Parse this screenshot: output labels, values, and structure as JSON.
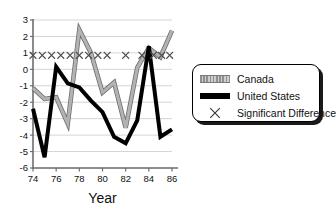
{
  "chart_data": {
    "type": "line",
    "title": "",
    "xlabel": "Year",
    "ylabel": "",
    "xlim": [
      74,
      86
    ],
    "ylim": [
      -6,
      3
    ],
    "grid": true,
    "grid_axis": "y",
    "legend_position": "right-outside",
    "x": [
      74,
      75,
      76,
      77,
      78,
      79,
      80,
      81,
      82,
      83,
      84,
      85,
      86
    ],
    "xtick_labels": [
      "74",
      "76",
      "78",
      "80",
      "82",
      "84",
      "86"
    ],
    "xtick_values": [
      74,
      76,
      78,
      80,
      82,
      84,
      86
    ],
    "ytick_labels": [
      "3",
      "2",
      "1",
      "0",
      "-1",
      "-2",
      "-3",
      "-4",
      "-5",
      "-6"
    ],
    "ytick_values": [
      3,
      2,
      1,
      0,
      -1,
      -2,
      -3,
      -4,
      -5,
      -6
    ],
    "series": [
      {
        "name": "Canada",
        "color": "#9a9a9a",
        "style": "thick-gray-line",
        "values": [
          -1.15,
          -1.8,
          -1.7,
          -3.3,
          2.4,
          1.0,
          -1.4,
          -0.8,
          -3.55,
          0.1,
          1.3,
          0.75,
          2.35
        ]
      },
      {
        "name": "United States",
        "color": "#000000",
        "style": "thick-black-line",
        "values": [
          -2.4,
          -5.35,
          0.15,
          -0.85,
          -1.1,
          -1.9,
          -2.6,
          -4.1,
          -4.5,
          -3.1,
          1.4,
          -4.1,
          -3.65
        ]
      }
    ],
    "annotations": {
      "name": "Significant Difference",
      "marker": "x",
      "y": 0.85,
      "x_values": [
        74,
        74.8,
        75.6,
        76.4,
        77.2,
        78,
        78.8,
        79.6,
        80.4,
        82,
        83.4,
        84.4,
        85.1,
        85.8
      ]
    }
  },
  "legend": {
    "items": [
      {
        "label": "Canada",
        "key": "canada-swatch"
      },
      {
        "label": "United States",
        "key": "united-states-swatch"
      },
      {
        "label": "Significant Difference",
        "key": "significant-difference-marker"
      }
    ]
  },
  "axes": {
    "x_title": "Year"
  }
}
